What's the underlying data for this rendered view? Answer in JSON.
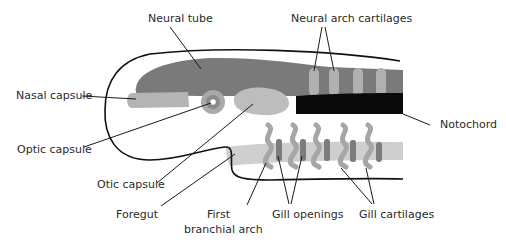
{
  "diagram": {
    "type": "anatomical-schematic",
    "labels": {
      "neural_tube": "Neural tube",
      "neural_arch_cartilages": "Neural arch cartilages",
      "nasal_capsule": "Nasal capsule",
      "notochord": "Notochord",
      "optic_capsule": "Optic capsule",
      "otic_capsule": "Otic capsule",
      "foregut": "Foregut",
      "first_branchial_arch_line1": "First",
      "first_branchial_arch_line2": "branchial arch",
      "gill_openings": "Gill openings",
      "gill_cartilages": "Gill cartilages"
    },
    "colors": {
      "neural_tube": "#7a7a7a",
      "light_cartilage": "#b4b4b4",
      "otic_capsule": "#bdbdbd",
      "optic_outer": "#a9a9a9",
      "optic_inner": "#8a8a8a",
      "notochord": "#0a0a0a",
      "foregut_band": "#cfcfcf",
      "gill_opening": "#7c7c7c",
      "gill_cartilage": "#a6a6a6",
      "outline": "#111111"
    },
    "counts": {
      "neural_arch_cartilages": 4,
      "gill_cartilages": 5,
      "gill_openings": 5
    }
  }
}
